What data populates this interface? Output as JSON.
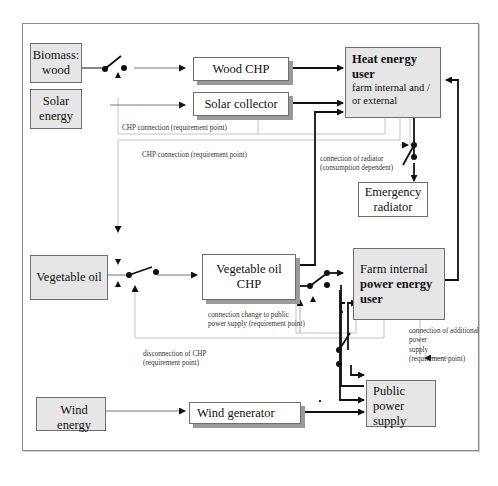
{
  "diagram": {
    "sources": {
      "biomass": "Biomass: wood",
      "solar": "Solar energy",
      "vegoil": "Vegetable oil",
      "wind": "Wind energy"
    },
    "converters": {
      "wood_chp": "Wood CHP",
      "solar_collector": "Solar collector",
      "vegoil_chp": "Vegetable oil CHP",
      "wind_generator": "Wind generator"
    },
    "users": {
      "heat_title": "Heat energy user",
      "heat_sub": "farm internal and / or external",
      "power_line1": "Farm internal",
      "power_title": "power energy user",
      "public_power": "Public power supply",
      "emergency_radiator": "Emergency radiator"
    },
    "labels": {
      "chp_connection_1": "CHP connection  (requirement point)",
      "chp_connection_2": "CHP connection  (requirement point)",
      "radiator_connection_1": "connection of radiator",
      "radiator_connection_2": "(consumption dependent)",
      "connection_change_1": "connection change to public",
      "connection_change_2": "power supply  (requirement point)",
      "disconnection_1": "disconnection   of CHP",
      "disconnection_2": "(requirement point)",
      "additional_1": "connection   of additional",
      "additional_2": "power",
      "additional_3": "supply",
      "additional_4": "(requirement point)"
    }
  }
}
